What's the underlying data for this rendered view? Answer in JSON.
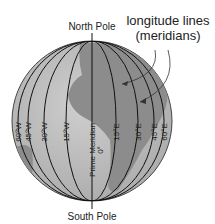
{
  "title": {
    "line1": "longitude lines",
    "line2": "(meridians)"
  },
  "poles": {
    "north": "North Pole",
    "south": "South Pole"
  },
  "meridians": [
    {
      "label": "60°W",
      "rx": 74,
      "side": -1
    },
    {
      "label": "45°W",
      "rx": 64,
      "side": -1
    },
    {
      "label": "30°W",
      "rx": 48,
      "side": -1
    },
    {
      "label": "15°W",
      "rx": 26,
      "side": -1
    },
    {
      "label": "Prime Meridian",
      "sub": "0°",
      "rx": 0,
      "side": 0
    },
    {
      "label": "15°E",
      "rx": 24,
      "side": 1
    },
    {
      "label": "30°E",
      "rx": 46,
      "side": 1
    },
    {
      "label": "45°E",
      "rx": 62,
      "side": 1
    },
    {
      "label": "60°E",
      "rx": 72,
      "side": 1
    }
  ],
  "colors": {
    "ocean": "#bdbdbd",
    "land": "#8c8c8c",
    "line": "#111111"
  }
}
